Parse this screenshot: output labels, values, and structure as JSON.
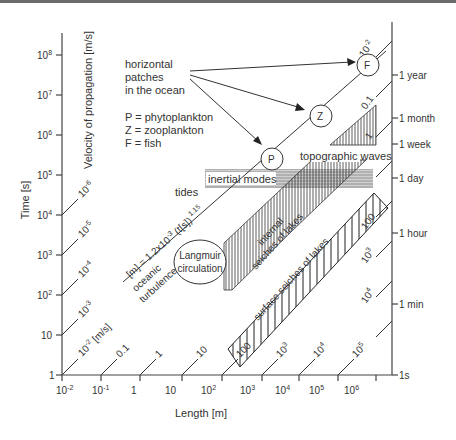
{
  "diagram": {
    "x_axis": {
      "label": "Length [m]",
      "ticks": [
        "10-2",
        "10-1",
        "1",
        "10",
        "102",
        "103",
        "104",
        "105",
        "106"
      ]
    },
    "y_axis": {
      "label": "Time [s]",
      "ticks": [
        "1",
        "10",
        "102",
        "103",
        "104",
        "105",
        "106",
        "107",
        "108"
      ]
    },
    "right_axis": {
      "ticks": [
        "1s",
        "1 min",
        "1 hour",
        "1 day",
        "1 week",
        "1 month",
        "1 year"
      ]
    },
    "velocity": {
      "label": "Velocity of propagation [m/s]",
      "left_labels": [
        "10-2 [m/s]",
        "10-3",
        "10-4",
        "10-5",
        "10-6"
      ],
      "bottom_labels": [
        "0.1",
        "1",
        "10",
        "100",
        "103",
        "104",
        "105"
      ],
      "right_labels": [
        "10-2",
        "0.1",
        "1",
        "10",
        "100",
        "103",
        "104"
      ]
    },
    "annotations": {
      "patches_line1": "horizontal",
      "patches_line2": "patches",
      "patches_line3": "in the ocean",
      "legend_p": "P = phytoplankton",
      "legend_z": "Z = zooplankton",
      "legend_f": "F = fish",
      "circle_p": "P",
      "circle_z": "Z",
      "circle_f": "F",
      "formula": "[m] = 1.2x10-3 (t[s]) 1.15",
      "oceanic_1": "oceanic",
      "oceanic_2": "turbulence",
      "tides": "tides",
      "inertial": "inertial modes",
      "topographic": "topographic waves",
      "langmuir_1": "Langmuir",
      "langmuir_2": "circulation",
      "internal_1": "internal",
      "internal_2": "seiches of lakes",
      "surface": "surface seiches of lakes"
    }
  }
}
